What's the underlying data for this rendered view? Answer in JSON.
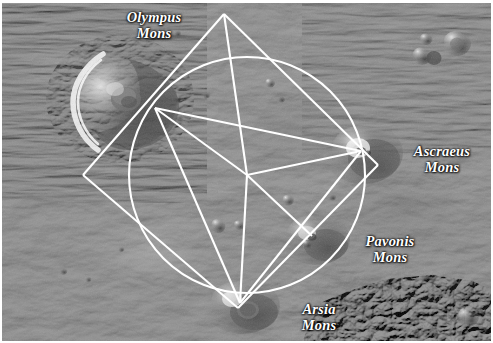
{
  "scene": {
    "kind": "mars-surface-photograph",
    "subject": "Tharsis volcanic province of Mars with geometric overlay",
    "background_color": "#8d8d8d",
    "border_color": "#ffffff",
    "overlay_color": "#ffffff",
    "overlay_line_width": 2.1
  },
  "labels": [
    {
      "id": "olympus",
      "text": "Olympus\nMons",
      "x": 152,
      "y": 28
    },
    {
      "id": "ascraeus",
      "text": "Ascraeus\nMons",
      "x": 440,
      "y": 162
    },
    {
      "id": "pavonis",
      "text": "Pavonis\nMons",
      "x": 388,
      "y": 252
    },
    {
      "id": "arsia",
      "text": "Arsia\nMons",
      "x": 317,
      "y": 320
    }
  ],
  "volcanoes": [
    {
      "name": "Olympus Mons",
      "x": 120,
      "y": 95,
      "radius": 52,
      "type": "shield-volcano"
    },
    {
      "name": "Ascraeus Mons",
      "x": 359,
      "y": 148,
      "radius": 26,
      "type": "shield-volcano"
    },
    {
      "name": "Pavonis Mons",
      "x": 310,
      "y": 233,
      "radius": 22,
      "type": "shield-volcano"
    },
    {
      "name": "Arsia Mons",
      "x": 238,
      "y": 300,
      "radius": 24,
      "type": "shield-volcano"
    }
  ],
  "overlay_geometry": {
    "circle": {
      "cx": 245,
      "cy": 172,
      "r": 118
    },
    "hub": {
      "x": 245,
      "y": 172
    },
    "apex": {
      "x": 222,
      "y": 11
    },
    "diamond": [
      [
        222,
        11
      ],
      [
        376,
        162
      ],
      [
        236,
        305
      ],
      [
        81,
        172
      ]
    ],
    "spokes": [
      {
        "from": [
          245,
          172
        ],
        "to": [
          359,
          148
        ],
        "name": "hub-to-ascraeus"
      },
      {
        "from": [
          245,
          172
        ],
        "to": [
          310,
          233
        ],
        "name": "hub-to-pavonis"
      },
      {
        "from": [
          245,
          172
        ],
        "to": [
          238,
          300
        ],
        "name": "hub-to-arsia"
      },
      {
        "from": [
          245,
          172
        ],
        "to": [
          153,
          105
        ],
        "name": "hub-to-olympus"
      },
      {
        "from": [
          245,
          172
        ],
        "to": [
          222,
          11
        ],
        "name": "hub-to-apex"
      }
    ],
    "chords": [
      {
        "from": [
          359,
          148
        ],
        "to": [
          238,
          300
        ],
        "name": "ascraeus-arsia"
      },
      {
        "from": [
          359,
          148
        ],
        "to": [
          153,
          105
        ],
        "name": "ascraeus-olympus"
      },
      {
        "from": [
          153,
          105
        ],
        "to": [
          238,
          300
        ],
        "name": "olympus-arsia"
      }
    ]
  },
  "craters": [
    {
      "x": 455,
      "y": 40,
      "r": 13
    },
    {
      "x": 424,
      "y": 36,
      "r": 6
    },
    {
      "x": 420,
      "y": 52,
      "r": 9
    },
    {
      "x": 431,
      "y": 54,
      "r": 7
    },
    {
      "x": 216,
      "y": 223,
      "r": 7
    },
    {
      "x": 237,
      "y": 222,
      "r": 5
    },
    {
      "x": 286,
      "y": 197,
      "r": 6
    },
    {
      "x": 305,
      "y": 240,
      "r": 5
    },
    {
      "x": 246,
      "y": 307,
      "r": 11
    },
    {
      "x": 466,
      "y": 314,
      "r": 10
    },
    {
      "x": 175,
      "y": 30,
      "r": 4
    },
    {
      "x": 204,
      "y": 92,
      "r": 4
    },
    {
      "x": 268,
      "y": 80,
      "r": 5
    },
    {
      "x": 279,
      "y": 96,
      "r": 4
    },
    {
      "x": 330,
      "y": 194,
      "r": 4
    },
    {
      "x": 61,
      "y": 268,
      "r": 4
    }
  ]
}
